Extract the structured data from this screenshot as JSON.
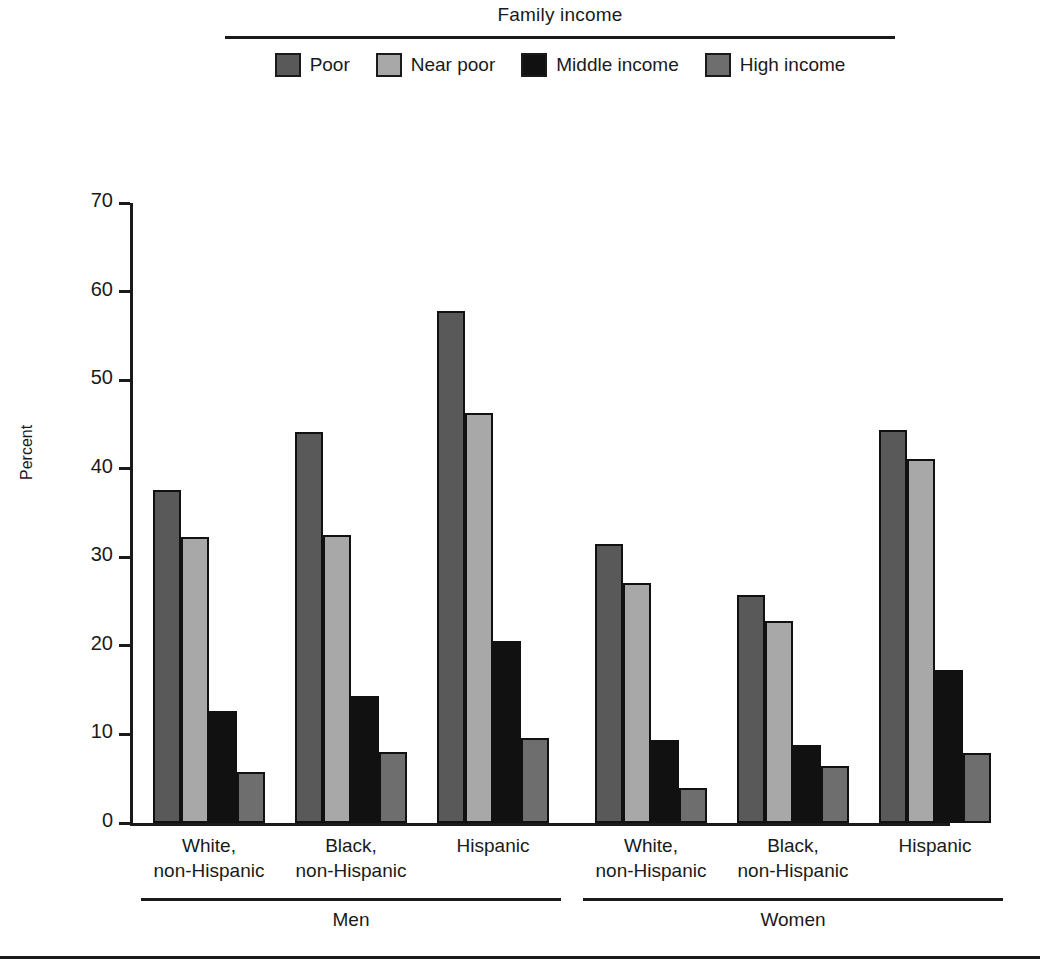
{
  "legend": {
    "title": "Family income",
    "items": [
      {
        "label": "Poor",
        "color": "#595959"
      },
      {
        "label": "Near poor",
        "color": "#a8a8a8"
      },
      {
        "label": "Middle income",
        "color": "#111111"
      },
      {
        "label": "High income",
        "color": "#6e6e6e"
      }
    ]
  },
  "axis": {
    "ylabel": "Percent",
    "yticks": [
      "0",
      "10",
      "20",
      "30",
      "40",
      "50",
      "60",
      "70"
    ]
  },
  "supergroups": [
    {
      "label": "Men"
    },
    {
      "label": "Women"
    }
  ],
  "categories": [
    {
      "line1": "White,",
      "line2": "non-Hispanic"
    },
    {
      "line1": "Black,",
      "line2": "non-Hispanic"
    },
    {
      "line1": "Hispanic",
      "line2": ""
    },
    {
      "line1": "White,",
      "line2": "non-Hispanic"
    },
    {
      "line1": "Black,",
      "line2": "non-Hispanic"
    },
    {
      "line1": "Hispanic",
      "line2": ""
    }
  ],
  "chart_data": {
    "type": "bar",
    "title": "Family income",
    "xlabel": "",
    "ylabel": "Percent",
    "ylim": [
      0,
      70
    ],
    "ytick_step": 10,
    "grid": false,
    "legend_position": "top",
    "categories": [
      "Men - White, non-Hispanic",
      "Men - Black, non-Hispanic",
      "Men - Hispanic",
      "Women - White, non-Hispanic",
      "Women - Black, non-Hispanic",
      "Women - Hispanic"
    ],
    "series": [
      {
        "name": "Poor",
        "color": "#595959",
        "values": [
          37.6,
          44.1,
          57.8,
          31.5,
          25.7,
          44.4
        ]
      },
      {
        "name": "Near poor",
        "color": "#a8a8a8",
        "values": [
          32.3,
          32.5,
          46.3,
          27.1,
          22.8,
          41.1
        ]
      },
      {
        "name": "Middle income",
        "color": "#111111",
        "values": [
          12.7,
          14.3,
          20.6,
          9.4,
          8.8,
          17.3
        ]
      },
      {
        "name": "High income",
        "color": "#6e6e6e",
        "values": [
          5.8,
          8.0,
          9.6,
          3.9,
          6.4,
          7.9
        ]
      }
    ]
  }
}
